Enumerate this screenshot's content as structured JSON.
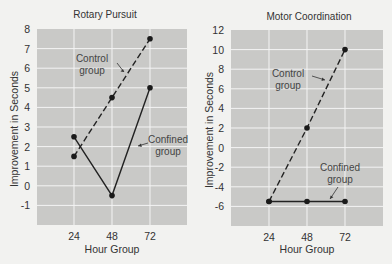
{
  "chart_data": [
    {
      "type": "line",
      "title": "Rotary Pursuit",
      "xlabel": "Hour Group",
      "ylabel": "Improvement in Seconds",
      "categories": [
        24,
        48,
        72
      ],
      "x_ticks": [
        "24",
        "48",
        "72"
      ],
      "y_ticks": [
        8,
        7,
        6,
        5,
        4,
        3,
        2,
        1,
        0,
        -1
      ],
      "ylim": [
        -2,
        8
      ],
      "grid": true,
      "series": [
        {
          "name": "Control group",
          "style": "dashed",
          "values": [
            1.5,
            4.5,
            7.5
          ]
        },
        {
          "name": "Confined group",
          "style": "solid",
          "values": [
            2.5,
            -0.5,
            5
          ]
        }
      ],
      "annotations": [
        {
          "text": [
            "Control",
            "group"
          ],
          "target": "Control group"
        },
        {
          "text": [
            "Confined",
            "group"
          ],
          "target": "Confined group"
        }
      ]
    },
    {
      "type": "line",
      "title": "Motor Coordination",
      "xlabel": "Hour Group",
      "ylabel": "Improvement in Seconds",
      "categories": [
        24,
        48,
        72
      ],
      "x_ticks": [
        "24",
        "48",
        "72"
      ],
      "y_ticks": [
        12,
        10,
        8,
        6,
        4,
        2,
        0,
        -2,
        -4,
        -6
      ],
      "ylim": [
        -8,
        12
      ],
      "grid": true,
      "series": [
        {
          "name": "Control group",
          "style": "dashed",
          "values": [
            -5.5,
            2,
            10
          ]
        },
        {
          "name": "Confined group",
          "style": "solid",
          "values": [
            -5.5,
            -5.5,
            -5.5
          ]
        }
      ],
      "annotations": [
        {
          "text": [
            "Control",
            "group"
          ],
          "target": "Control group"
        },
        {
          "text": [
            "Confined",
            "group"
          ],
          "target": "Confined group"
        }
      ]
    }
  ]
}
